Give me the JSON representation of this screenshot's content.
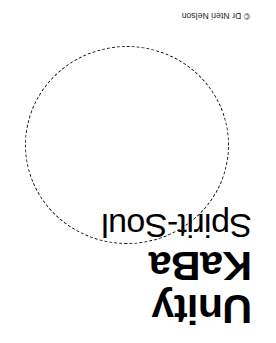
{
  "artwork": {
    "rotation_degrees": 180,
    "background_color": "#ffffff",
    "ink_color": "#000000",
    "title_lines": [
      {
        "text": "Unity",
        "weight": "bold"
      },
      {
        "text": "KaBa",
        "weight": "bold"
      },
      {
        "text": "Spirit-Soul",
        "weight": "regular"
      }
    ],
    "shape": {
      "name": "dashed-circle",
      "stroke_style": "dashed",
      "stroke_color": "#111111",
      "fill": "none"
    },
    "credit": "© Dr Nteri Nelson"
  }
}
